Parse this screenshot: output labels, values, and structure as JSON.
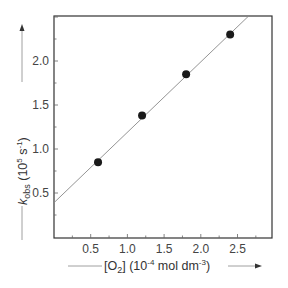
{
  "chart_data": {
    "type": "scatter",
    "title": "",
    "xlabel": "[O2] (10^-4 mol dm^-3)",
    "ylabel": "k_obs (10^5 s^-1)",
    "xlim": [
      0,
      2.95
    ],
    "ylim": [
      0,
      2.55
    ],
    "grid": false,
    "legend": null,
    "x_ticks": [
      0.5,
      1.0,
      1.5,
      2.0,
      2.5
    ],
    "x_tick_labels": [
      "0.5",
      "1.0",
      "1.5",
      "2.0",
      "2.5"
    ],
    "y_ticks": [
      0.5,
      1.0,
      1.5,
      2.0
    ],
    "y_tick_labels": [
      "0.5",
      "1.0",
      "1.5",
      "2.0"
    ],
    "series": [
      {
        "name": "data",
        "marker": "filled-circle",
        "x": [
          0.6,
          1.2,
          1.8,
          2.4
        ],
        "y": [
          0.85,
          1.38,
          1.85,
          2.3
        ]
      }
    ],
    "fit_line": {
      "slope": 0.8,
      "intercept": 0.39
    }
  },
  "labels": {
    "x_axis": {
      "prefix": "[O",
      "sub": "2",
      "mid": "] (10",
      "sup1": "-4",
      "mid2": " mol dm",
      "sup2": "-3",
      "suffix": ")"
    },
    "y_axis": {
      "k": "k",
      "sub": "obs",
      "mid": " (10",
      "sup": "5",
      "mid2": " s",
      "sup2": "-1",
      "suffix": ")"
    }
  },
  "colors": {
    "frame": "#333333",
    "points": "#1a1a1a",
    "line": "#888888",
    "text": "#444444"
  }
}
